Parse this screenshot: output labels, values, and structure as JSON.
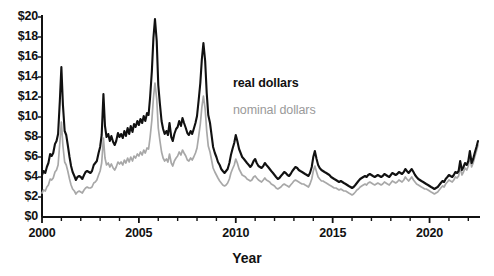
{
  "chart_data": {
    "type": "line",
    "title": "",
    "xlabel": "Year",
    "ylabel": "",
    "xlim": [
      2000.0,
      2022.5
    ],
    "ylim": [
      0,
      20
    ],
    "grid": false,
    "legend_position": "inside-upper-right",
    "y_tick_labels": [
      "$20",
      "$18",
      "$16",
      "$14",
      "$12",
      "$10",
      "$8",
      "$6",
      "$4",
      "$2",
      "$0"
    ],
    "y_tick_values": [
      20,
      18,
      16,
      14,
      12,
      10,
      8,
      6,
      4,
      2,
      0
    ],
    "y_tick_step": 2,
    "x_tick_labels": [
      "2000",
      "2005",
      "2010",
      "2015",
      "2020"
    ],
    "x_tick_values": [
      2000,
      2005,
      2010,
      2015,
      2020
    ],
    "x_minor_tick_step": 1,
    "colors": {
      "real": "#111111",
      "nominal": "#a8a8a8",
      "axis": "#111111"
    },
    "series": [
      {
        "name": "real dollars",
        "color": "#111111",
        "x": [
          2000.0,
          2000.08,
          2000.17,
          2000.25,
          2000.33,
          2000.42,
          2000.5,
          2000.58,
          2000.67,
          2000.75,
          2000.83,
          2000.92,
          2001.0,
          2001.08,
          2001.17,
          2001.25,
          2001.33,
          2001.42,
          2001.5,
          2001.58,
          2001.67,
          2001.75,
          2001.83,
          2001.92,
          2002.0,
          2002.08,
          2002.17,
          2002.25,
          2002.33,
          2002.42,
          2002.5,
          2002.58,
          2002.67,
          2002.75,
          2002.83,
          2002.92,
          2003.0,
          2003.08,
          2003.17,
          2003.25,
          2003.33,
          2003.42,
          2003.5,
          2003.58,
          2003.67,
          2003.75,
          2003.83,
          2003.92,
          2004.0,
          2004.08,
          2004.17,
          2004.25,
          2004.33,
          2004.42,
          2004.5,
          2004.58,
          2004.67,
          2004.75,
          2004.83,
          2004.92,
          2005.0,
          2005.08,
          2005.17,
          2005.25,
          2005.33,
          2005.42,
          2005.5,
          2005.58,
          2005.67,
          2005.75,
          2005.83,
          2005.92,
          2006.0,
          2006.08,
          2006.17,
          2006.25,
          2006.33,
          2006.42,
          2006.5,
          2006.58,
          2006.67,
          2006.75,
          2006.83,
          2006.92,
          2007.0,
          2007.08,
          2007.17,
          2007.25,
          2007.33,
          2007.42,
          2007.5,
          2007.58,
          2007.67,
          2007.75,
          2007.83,
          2007.92,
          2008.0,
          2008.08,
          2008.17,
          2008.25,
          2008.33,
          2008.42,
          2008.5,
          2008.58,
          2008.67,
          2008.75,
          2008.83,
          2008.92,
          2009.0,
          2009.08,
          2009.17,
          2009.25,
          2009.33,
          2009.42,
          2009.5,
          2009.58,
          2009.67,
          2009.75,
          2009.83,
          2009.92,
          2010.0,
          2010.08,
          2010.17,
          2010.25,
          2010.33,
          2010.42,
          2010.5,
          2010.58,
          2010.67,
          2010.75,
          2010.83,
          2010.92,
          2011.0,
          2011.08,
          2011.17,
          2011.25,
          2011.33,
          2011.42,
          2011.5,
          2011.58,
          2011.67,
          2011.75,
          2011.83,
          2011.92,
          2012.0,
          2012.08,
          2012.17,
          2012.25,
          2012.33,
          2012.42,
          2012.5,
          2012.58,
          2012.67,
          2012.75,
          2012.83,
          2012.92,
          2013.0,
          2013.08,
          2013.17,
          2013.25,
          2013.33,
          2013.42,
          2013.5,
          2013.58,
          2013.67,
          2013.75,
          2013.83,
          2013.92,
          2014.0,
          2014.08,
          2014.17,
          2014.25,
          2014.33,
          2014.42,
          2014.5,
          2014.58,
          2014.67,
          2014.75,
          2014.83,
          2014.92,
          2015.0,
          2015.08,
          2015.17,
          2015.25,
          2015.33,
          2015.42,
          2015.5,
          2015.58,
          2015.67,
          2015.75,
          2015.83,
          2015.92,
          2016.0,
          2016.08,
          2016.17,
          2016.25,
          2016.33,
          2016.42,
          2016.5,
          2016.58,
          2016.67,
          2016.75,
          2016.83,
          2016.92,
          2017.0,
          2017.08,
          2017.17,
          2017.25,
          2017.33,
          2017.42,
          2017.5,
          2017.58,
          2017.67,
          2017.75,
          2017.83,
          2017.92,
          2018.0,
          2018.08,
          2018.17,
          2018.25,
          2018.33,
          2018.42,
          2018.5,
          2018.58,
          2018.67,
          2018.75,
          2018.83,
          2018.92,
          2019.0,
          2019.08,
          2019.17,
          2019.25,
          2019.33,
          2019.42,
          2019.5,
          2019.58,
          2019.67,
          2019.75,
          2019.83,
          2019.92,
          2020.0,
          2020.08,
          2020.17,
          2020.25,
          2020.33,
          2020.42,
          2020.5,
          2020.58,
          2020.67,
          2020.75,
          2020.83,
          2020.92,
          2021.0,
          2021.08,
          2021.17,
          2021.25,
          2021.33,
          2021.42,
          2021.5,
          2021.58,
          2021.67,
          2021.75,
          2021.83,
          2021.92,
          2022.0,
          2022.08,
          2022.17,
          2022.25,
          2022.33,
          2022.42,
          2022.5
        ],
        "y": [
          4.2,
          4.6,
          4.4,
          5.0,
          5.4,
          6.3,
          6.1,
          6.4,
          7.3,
          7.6,
          8.3,
          11.6,
          15.0,
          11.2,
          8.6,
          8.2,
          7.2,
          6.0,
          5.1,
          4.5,
          4.1,
          3.7,
          4.0,
          4.1,
          4.0,
          3.8,
          4.2,
          4.5,
          4.6,
          4.5,
          4.4,
          4.6,
          5.2,
          5.4,
          5.6,
          6.4,
          7.0,
          8.2,
          12.3,
          9.1,
          8.0,
          8.3,
          7.6,
          8.1,
          7.5,
          7.2,
          7.6,
          8.4,
          8.0,
          8.3,
          7.9,
          8.6,
          8.1,
          8.9,
          8.3,
          9.1,
          8.5,
          9.3,
          9.0,
          9.6,
          9.2,
          9.8,
          9.4,
          10.1,
          9.6,
          10.4,
          10.2,
          12.0,
          14.6,
          17.9,
          19.8,
          17.6,
          13.2,
          11.4,
          9.6,
          8.8,
          8.3,
          8.6,
          8.2,
          9.4,
          8.0,
          7.6,
          8.3,
          8.8,
          9.0,
          9.6,
          9.1,
          9.9,
          9.4,
          8.9,
          8.4,
          8.2,
          8.6,
          8.3,
          8.8,
          9.4,
          10.1,
          11.6,
          13.4,
          15.8,
          17.4,
          15.6,
          12.4,
          10.2,
          9.4,
          8.2,
          7.0,
          6.4,
          6.0,
          5.5,
          5.2,
          4.8,
          4.6,
          4.4,
          4.6,
          4.8,
          5.4,
          6.2,
          6.8,
          7.4,
          8.2,
          7.6,
          6.8,
          6.4,
          6.0,
          5.8,
          5.6,
          5.4,
          5.2,
          5.0,
          5.2,
          5.6,
          5.8,
          5.4,
          5.1,
          5.0,
          4.9,
          5.1,
          5.4,
          5.2,
          5.0,
          4.8,
          4.6,
          4.4,
          4.2,
          4.0,
          3.8,
          3.9,
          4.1,
          4.3,
          4.5,
          4.4,
          4.2,
          4.1,
          4.3,
          4.6,
          4.8,
          5.0,
          4.9,
          4.7,
          4.6,
          4.5,
          4.4,
          4.3,
          4.2,
          4.1,
          4.4,
          5.0,
          6.0,
          6.6,
          5.8,
          5.2,
          4.9,
          4.7,
          4.6,
          4.5,
          4.4,
          4.3,
          4.2,
          4.0,
          3.9,
          3.8,
          3.7,
          3.6,
          3.5,
          3.6,
          3.5,
          3.4,
          3.3,
          3.2,
          3.1,
          3.0,
          2.9,
          3.0,
          3.2,
          3.4,
          3.6,
          3.8,
          3.9,
          4.0,
          4.1,
          4.0,
          4.2,
          4.3,
          4.2,
          4.1,
          4.0,
          4.1,
          4.2,
          4.1,
          4.0,
          4.1,
          4.3,
          4.2,
          4.1,
          4.0,
          4.2,
          4.4,
          4.3,
          4.2,
          4.3,
          4.5,
          4.4,
          4.3,
          4.5,
          4.8,
          4.6,
          4.4,
          4.6,
          4.8,
          4.5,
          4.2,
          4.0,
          3.8,
          3.7,
          3.6,
          3.5,
          3.4,
          3.3,
          3.2,
          3.1,
          3.0,
          2.9,
          2.8,
          2.9,
          3.0,
          3.2,
          3.4,
          3.6,
          3.5,
          3.8,
          4.0,
          4.2,
          4.1,
          4.0,
          4.2,
          4.5,
          4.4,
          4.6,
          5.6,
          4.7,
          5.0,
          5.4,
          5.2,
          5.6,
          6.6,
          5.4,
          5.8,
          6.4,
          7.0,
          7.6
        ]
      },
      {
        "name": "nominal dollars",
        "color": "#a8a8a8",
        "x": [
          2000.0,
          2000.08,
          2000.17,
          2000.25,
          2000.33,
          2000.42,
          2000.5,
          2000.58,
          2000.67,
          2000.75,
          2000.83,
          2000.92,
          2001.0,
          2001.08,
          2001.17,
          2001.25,
          2001.33,
          2001.42,
          2001.5,
          2001.58,
          2001.67,
          2001.75,
          2001.83,
          2001.92,
          2002.0,
          2002.08,
          2002.17,
          2002.25,
          2002.33,
          2002.42,
          2002.5,
          2002.58,
          2002.67,
          2002.75,
          2002.83,
          2002.92,
          2003.0,
          2003.08,
          2003.17,
          2003.25,
          2003.33,
          2003.42,
          2003.5,
          2003.58,
          2003.67,
          2003.75,
          2003.83,
          2003.92,
          2004.0,
          2004.08,
          2004.17,
          2004.25,
          2004.33,
          2004.42,
          2004.5,
          2004.58,
          2004.67,
          2004.75,
          2004.83,
          2004.92,
          2005.0,
          2005.08,
          2005.17,
          2005.25,
          2005.33,
          2005.42,
          2005.5,
          2005.58,
          2005.67,
          2005.75,
          2005.83,
          2005.92,
          2006.0,
          2006.08,
          2006.17,
          2006.25,
          2006.33,
          2006.42,
          2006.5,
          2006.58,
          2006.67,
          2006.75,
          2006.83,
          2006.92,
          2007.0,
          2007.08,
          2007.17,
          2007.25,
          2007.33,
          2007.42,
          2007.5,
          2007.58,
          2007.67,
          2007.75,
          2007.83,
          2007.92,
          2008.0,
          2008.08,
          2008.17,
          2008.25,
          2008.33,
          2008.42,
          2008.5,
          2008.58,
          2008.67,
          2008.75,
          2008.83,
          2008.92,
          2009.0,
          2009.08,
          2009.17,
          2009.25,
          2009.33,
          2009.42,
          2009.5,
          2009.58,
          2009.67,
          2009.75,
          2009.83,
          2009.92,
          2010.0,
          2010.08,
          2010.17,
          2010.25,
          2010.33,
          2010.42,
          2010.5,
          2010.58,
          2010.67,
          2010.75,
          2010.83,
          2010.92,
          2011.0,
          2011.08,
          2011.17,
          2011.25,
          2011.33,
          2011.42,
          2011.5,
          2011.58,
          2011.67,
          2011.75,
          2011.83,
          2011.92,
          2012.0,
          2012.08,
          2012.17,
          2012.25,
          2012.33,
          2012.42,
          2012.5,
          2012.58,
          2012.67,
          2012.75,
          2012.83,
          2012.92,
          2013.0,
          2013.08,
          2013.17,
          2013.25,
          2013.33,
          2013.42,
          2013.5,
          2013.58,
          2013.67,
          2013.75,
          2013.83,
          2013.92,
          2014.0,
          2014.08,
          2014.17,
          2014.25,
          2014.33,
          2014.42,
          2014.5,
          2014.58,
          2014.67,
          2014.75,
          2014.83,
          2014.92,
          2015.0,
          2015.08,
          2015.17,
          2015.25,
          2015.33,
          2015.42,
          2015.5,
          2015.58,
          2015.67,
          2015.75,
          2015.83,
          2015.92,
          2016.0,
          2016.08,
          2016.17,
          2016.25,
          2016.33,
          2016.42,
          2016.5,
          2016.58,
          2016.67,
          2016.75,
          2016.83,
          2016.92,
          2017.0,
          2017.08,
          2017.17,
          2017.25,
          2017.33,
          2017.42,
          2017.5,
          2017.58,
          2017.67,
          2017.75,
          2017.83,
          2017.92,
          2018.0,
          2018.08,
          2018.17,
          2018.25,
          2018.33,
          2018.42,
          2018.5,
          2018.58,
          2018.67,
          2018.75,
          2018.83,
          2018.92,
          2019.0,
          2019.08,
          2019.17,
          2019.25,
          2019.33,
          2019.42,
          2019.5,
          2019.58,
          2019.67,
          2019.75,
          2019.83,
          2019.92,
          2020.0,
          2020.08,
          2020.17,
          2020.25,
          2020.33,
          2020.42,
          2020.5,
          2020.58,
          2020.67,
          2020.75,
          2020.83,
          2020.92,
          2021.0,
          2021.08,
          2021.17,
          2021.25,
          2021.33,
          2021.42,
          2021.5,
          2021.58,
          2021.67,
          2021.75,
          2021.83,
          2021.92,
          2022.0,
          2022.08,
          2022.17,
          2022.25,
          2022.33,
          2022.42,
          2022.5
        ],
        "y": [
          2.4,
          2.7,
          2.6,
          3.0,
          3.2,
          3.8,
          3.7,
          3.9,
          4.5,
          4.7,
          5.2,
          7.4,
          9.5,
          7.1,
          5.5,
          5.2,
          4.6,
          3.8,
          3.2,
          2.8,
          2.6,
          2.3,
          2.5,
          2.6,
          2.5,
          2.4,
          2.7,
          2.9,
          3.0,
          2.9,
          2.9,
          3.0,
          3.4,
          3.5,
          3.7,
          4.2,
          4.6,
          5.4,
          7.9,
          5.9,
          5.2,
          5.4,
          5.0,
          5.3,
          4.9,
          4.7,
          5.0,
          5.5,
          5.3,
          5.5,
          5.2,
          5.7,
          5.4,
          5.9,
          5.5,
          6.0,
          5.6,
          6.1,
          5.9,
          6.3,
          6.1,
          6.5,
          6.2,
          6.7,
          6.4,
          6.9,
          6.8,
          8.0,
          9.7,
          11.9,
          13.4,
          11.8,
          8.9,
          7.7,
          6.5,
          5.9,
          5.6,
          5.8,
          5.5,
          6.3,
          5.4,
          5.1,
          5.6,
          5.9,
          6.1,
          6.5,
          6.2,
          6.7,
          6.4,
          6.1,
          5.7,
          5.6,
          5.9,
          5.7,
          6.0,
          6.4,
          6.9,
          8.0,
          9.3,
          11.0,
          12.1,
          10.8,
          8.6,
          7.1,
          6.5,
          5.7,
          4.9,
          4.5,
          4.2,
          3.9,
          3.6,
          3.4,
          3.2,
          3.1,
          3.2,
          3.4,
          3.8,
          4.4,
          4.8,
          5.2,
          5.8,
          5.4,
          4.8,
          4.5,
          4.2,
          4.1,
          4.0,
          3.8,
          3.7,
          3.6,
          3.7,
          4.0,
          4.1,
          3.9,
          3.7,
          3.6,
          3.5,
          3.7,
          3.9,
          3.7,
          3.6,
          3.5,
          3.3,
          3.2,
          3.1,
          2.9,
          2.8,
          2.9,
          3.0,
          3.2,
          3.3,
          3.2,
          3.1,
          3.0,
          3.2,
          3.4,
          3.6,
          3.7,
          3.6,
          3.5,
          3.4,
          3.3,
          3.3,
          3.2,
          3.1,
          3.0,
          3.3,
          3.8,
          4.6,
          5.1,
          4.5,
          4.0,
          3.8,
          3.6,
          3.6,
          3.5,
          3.4,
          3.3,
          3.2,
          3.1,
          3.0,
          2.9,
          2.9,
          2.8,
          2.7,
          2.8,
          2.7,
          2.6,
          2.6,
          2.5,
          2.4,
          2.3,
          2.2,
          2.3,
          2.5,
          2.7,
          2.8,
          3.0,
          3.1,
          3.2,
          3.3,
          3.2,
          3.4,
          3.5,
          3.4,
          3.3,
          3.2,
          3.3,
          3.4,
          3.3,
          3.2,
          3.3,
          3.5,
          3.4,
          3.3,
          3.2,
          3.4,
          3.6,
          3.5,
          3.4,
          3.5,
          3.7,
          3.6,
          3.5,
          3.7,
          4.0,
          3.8,
          3.6,
          3.8,
          4.0,
          3.7,
          3.5,
          3.3,
          3.2,
          3.1,
          3.0,
          2.9,
          2.8,
          2.8,
          2.7,
          2.6,
          2.5,
          2.4,
          2.3,
          2.4,
          2.5,
          2.7,
          2.9,
          3.1,
          3.0,
          3.3,
          3.5,
          3.7,
          3.6,
          3.5,
          3.7,
          4.0,
          3.9,
          4.1,
          5.0,
          4.2,
          4.5,
          4.9,
          4.7,
          5.1,
          6.1,
          5.0,
          5.4,
          6.0,
          6.6,
          7.2
        ]
      }
    ]
  },
  "legend": {
    "real_label": "real dollars",
    "nominal_label": "nominal dollars"
  },
  "axes": {
    "x_title": "Year"
  }
}
